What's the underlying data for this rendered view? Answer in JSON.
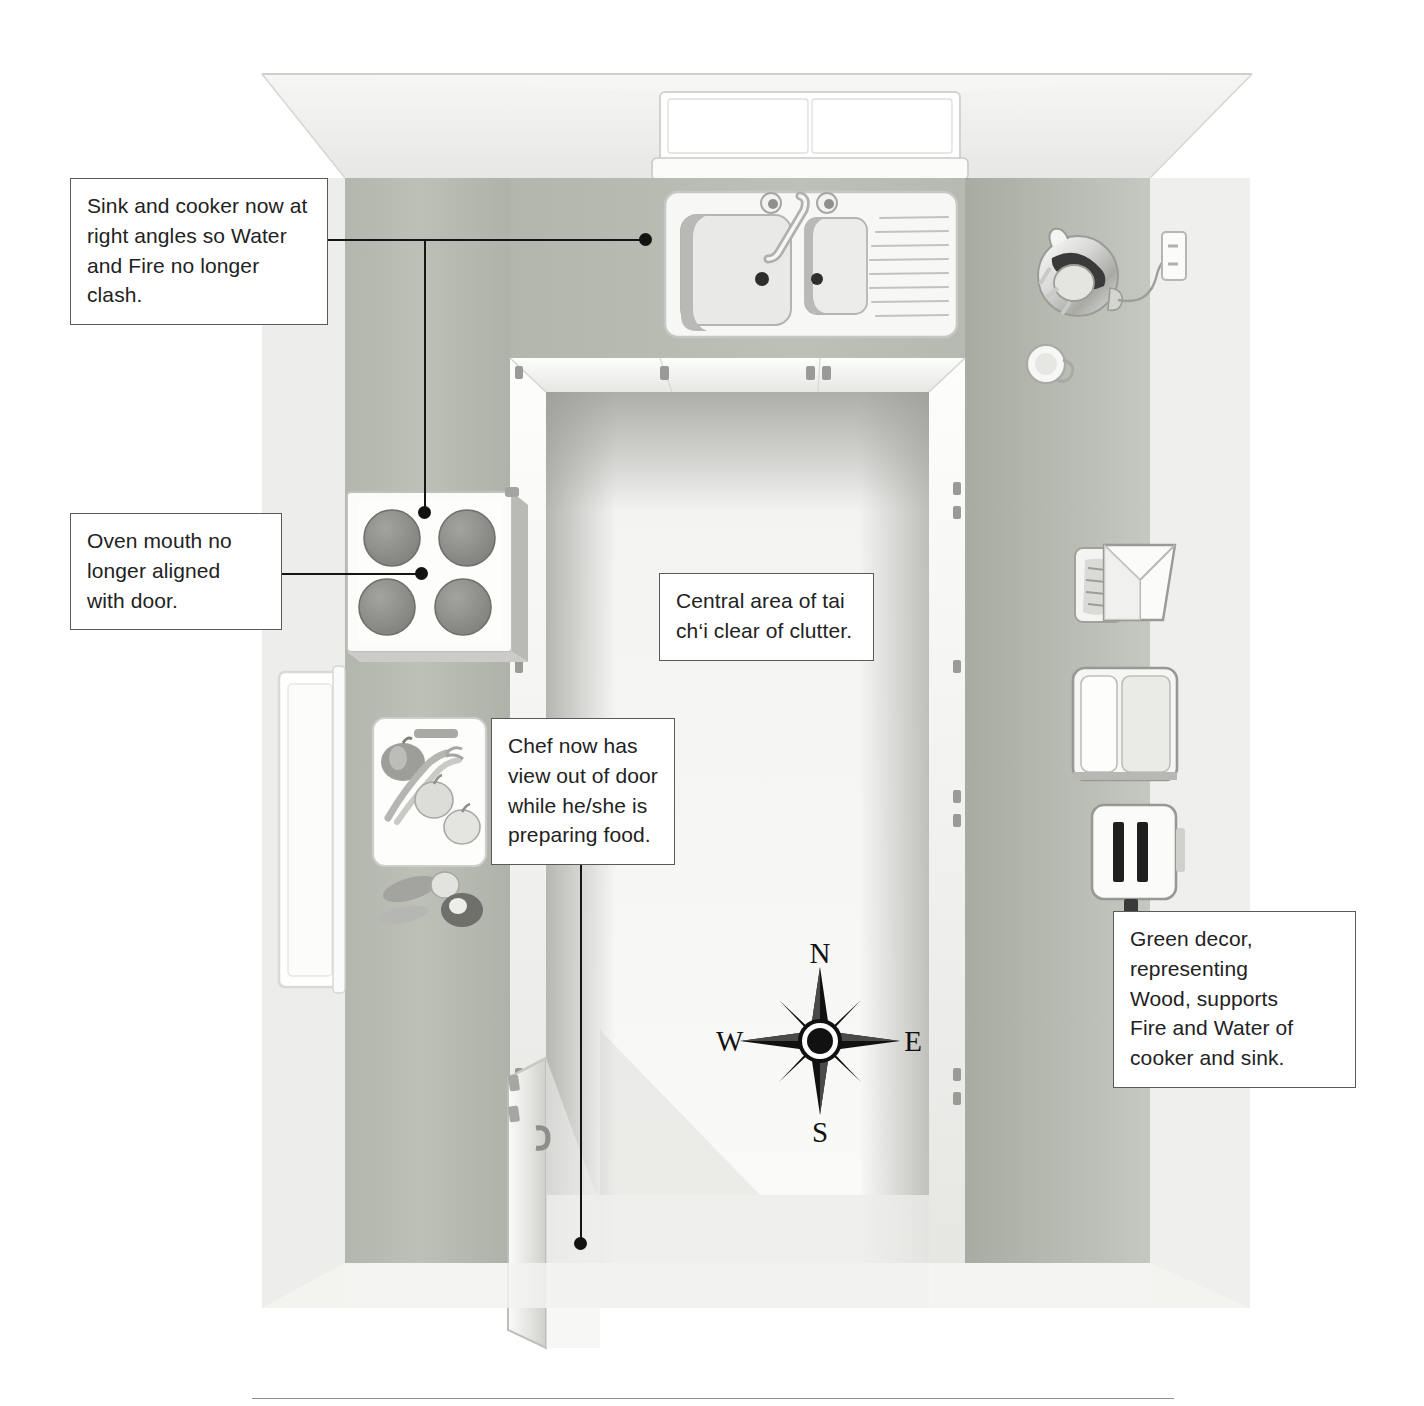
{
  "figure": {
    "kind": "annotated-illustration",
    "title_visible": false
  },
  "callouts": [
    {
      "id": "sink-cooker",
      "text": "Sink and cooker now at\nright angles so Water\nand Fire no longer clash.",
      "anchors": [
        "sink",
        "cooker-hob"
      ]
    },
    {
      "id": "oven-mouth",
      "text": "Oven mouth no\nlonger aligned\nwith door.",
      "anchors": [
        "cooker-hob"
      ]
    },
    {
      "id": "chef-view",
      "text": "Chef now has\nview out of door\nwhile he/she is\npreparing food.",
      "anchors": [
        "doorway"
      ]
    },
    {
      "id": "central-area",
      "text": "Central area of tai\nch‘i clear of clutter.",
      "anchors": []
    },
    {
      "id": "green-decor",
      "text": "Green decor,\nrepresenting\nWood, supports\nFire and Water of\ncooker and sink.",
      "anchors": []
    }
  ],
  "compass": {
    "name": "compass-rose",
    "points": {
      "north": "N",
      "east": "E",
      "south": "S",
      "west": "W"
    },
    "style": "eight-point star"
  },
  "scene_objects": [
    {
      "name": "back-window",
      "label": "window above sink"
    },
    {
      "name": "sink-unit",
      "label": "double-bowl sink with mixer tap and drainer"
    },
    {
      "name": "cooker-hob",
      "label": "four-ring hob / cooker"
    },
    {
      "name": "chopping-board",
      "label": "chopping board with vegetables"
    },
    {
      "name": "side-window",
      "label": "window on left wall"
    },
    {
      "name": "open-door",
      "label": "open door"
    },
    {
      "name": "kettle",
      "label": "electric kettle with flex to socket"
    },
    {
      "name": "cup",
      "label": "cup"
    },
    {
      "name": "wall-socket",
      "label": "wall socket"
    },
    {
      "name": "mixer-scales",
      "label": "food mixer / scales"
    },
    {
      "name": "bread-bin",
      "label": "bread bin"
    },
    {
      "name": "toaster",
      "label": "two-slot toaster"
    },
    {
      "name": "worktop",
      "label": "worktop counter run"
    },
    {
      "name": "floor",
      "label": "central floor area"
    }
  ],
  "colors": {
    "worktop_green": "#b9bdb4",
    "wall_light": "#e9e9e7",
    "floor": "#f4f4f2",
    "line": "#151515",
    "box_border": "#5a5a5a",
    "appliance_white": "#fbfbfa",
    "hob_ring": "#8c8c8c"
  }
}
